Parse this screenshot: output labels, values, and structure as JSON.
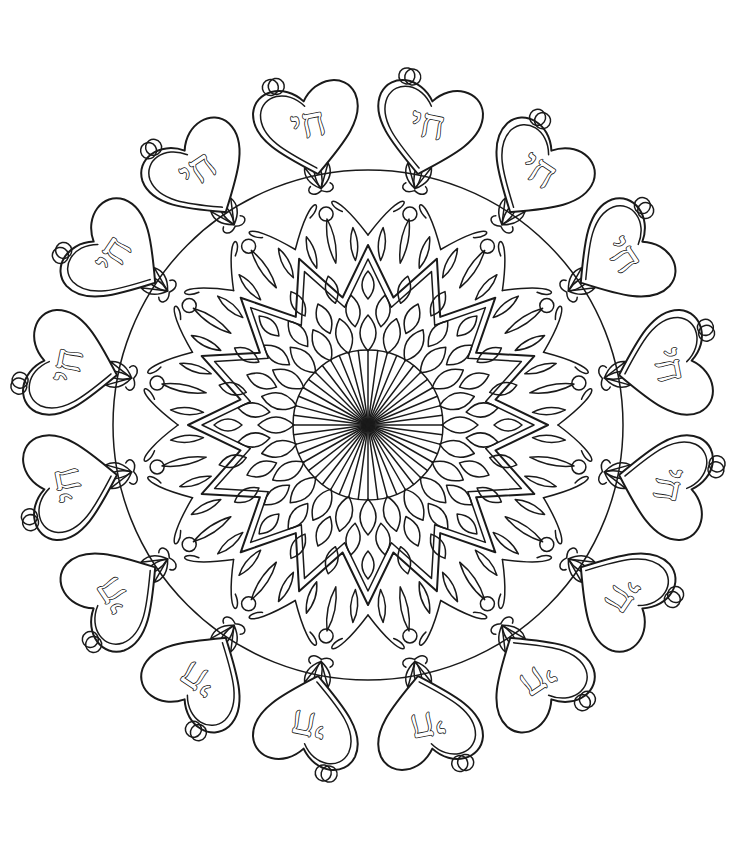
{
  "page": {
    "title": "Chai Mandala Coloring Page",
    "background": "#ffffff",
    "line_color": "#1a1a1a"
  },
  "mandala": {
    "center": [
      368,
      425
    ],
    "outer_radius": 330,
    "hearts": {
      "count": 16,
      "text": "חי",
      "radius": 300
    },
    "lotus_buds": {
      "count": 16,
      "radius": 210
    },
    "leaf_ring": {
      "count": 16,
      "radius": 170
    },
    "petal_rings": [
      {
        "count": 24,
        "radius": 140
      },
      {
        "count": 24,
        "radius": 115
      },
      {
        "count": 24,
        "radius": 92
      }
    ],
    "star_points": {
      "count": 16,
      "inner": 130,
      "outer": 180
    },
    "rays": {
      "count": 48,
      "radius": 75
    }
  }
}
